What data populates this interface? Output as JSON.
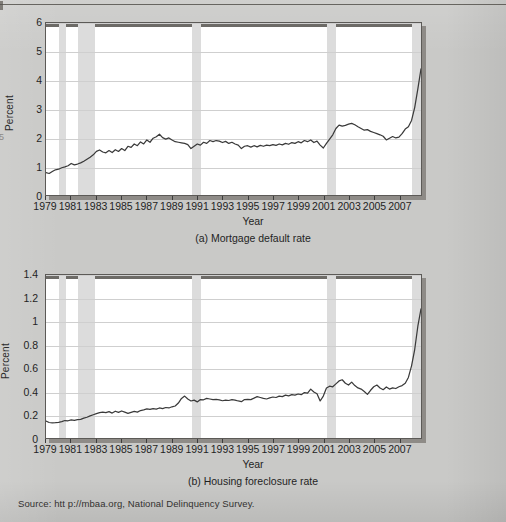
{
  "page": {
    "background_color": "#c9c9c7",
    "source_note": "Source: htt p://mbaa.org, National Delinquency Survey.",
    "margin_number": "5"
  },
  "chart_data": [
    {
      "id": "mortgage-default-rate",
      "type": "line",
      "title": "(a) Mortgage default rate",
      "xlabel": "Year",
      "ylabel": "Percent",
      "ylim": [
        0,
        6
      ],
      "xlim": [
        1979,
        2008.75
      ],
      "yticks": [
        "0",
        "1",
        "2",
        "3",
        "4",
        "5",
        "6"
      ],
      "ytick_values": [
        0,
        1,
        2,
        3,
        4,
        5,
        6
      ],
      "xticks": [
        "1979",
        "1981",
        "1983",
        "1985",
        "1987",
        "1989",
        "1991",
        "1993",
        "1995",
        "1997",
        "1999",
        "2001",
        "2003",
        "2005",
        "2007"
      ],
      "xtick_values": [
        1979,
        1981,
        1983,
        1985,
        1987,
        1989,
        1991,
        1993,
        1995,
        1997,
        1999,
        2001,
        2003,
        2005,
        2007
      ],
      "grid": true,
      "line_color": "#3a3a3a",
      "band_color": "#dcdcdc",
      "recession_bands": [
        [
          1980.0,
          1980.6
        ],
        [
          1981.5,
          1982.9
        ],
        [
          1990.5,
          1991.2
        ],
        [
          2001.2,
          2001.9
        ],
        [
          2007.9,
          2008.75
        ]
      ],
      "x": [
        1979.0,
        1979.25,
        1979.5,
        1979.75,
        1980.0,
        1980.25,
        1980.5,
        1980.75,
        1981.0,
        1981.25,
        1981.5,
        1981.75,
        1982.0,
        1982.25,
        1982.5,
        1982.75,
        1983.0,
        1983.25,
        1983.5,
        1983.75,
        1984.0,
        1984.25,
        1984.5,
        1984.75,
        1985.0,
        1985.25,
        1985.5,
        1985.75,
        1986.0,
        1986.25,
        1986.5,
        1986.75,
        1987.0,
        1987.25,
        1987.5,
        1987.75,
        1988.0,
        1988.25,
        1988.5,
        1988.75,
        1989.0,
        1989.25,
        1989.5,
        1989.75,
        1990.0,
        1990.25,
        1990.5,
        1990.75,
        1991.0,
        1991.25,
        1991.5,
        1991.75,
        1992.0,
        1992.25,
        1992.5,
        1992.75,
        1993.0,
        1993.25,
        1993.5,
        1993.75,
        1994.0,
        1994.25,
        1994.5,
        1994.75,
        1995.0,
        1995.25,
        1995.5,
        1995.75,
        1996.0,
        1996.25,
        1996.5,
        1996.75,
        1997.0,
        1997.25,
        1997.5,
        1997.75,
        1998.0,
        1998.25,
        1998.5,
        1998.75,
        1999.0,
        1999.25,
        1999.5,
        1999.75,
        2000.0,
        2000.25,
        2000.5,
        2000.75,
        2001.0,
        2001.25,
        2001.5,
        2001.75,
        2002.0,
        2002.25,
        2002.5,
        2002.75,
        2003.0,
        2003.25,
        2003.5,
        2003.75,
        2004.0,
        2004.25,
        2004.5,
        2004.75,
        2005.0,
        2005.25,
        2005.5,
        2005.75,
        2006.0,
        2006.25,
        2006.5,
        2006.75,
        2007.0,
        2007.25,
        2007.5,
        2007.75,
        2008.0,
        2008.25,
        2008.5,
        2008.75
      ],
      "values": [
        0.78,
        0.75,
        0.82,
        0.88,
        0.9,
        0.95,
        0.98,
        1.02,
        1.1,
        1.05,
        1.08,
        1.12,
        1.18,
        1.25,
        1.32,
        1.4,
        1.52,
        1.57,
        1.5,
        1.47,
        1.55,
        1.48,
        1.58,
        1.52,
        1.62,
        1.55,
        1.7,
        1.66,
        1.78,
        1.72,
        1.85,
        1.78,
        1.92,
        1.84,
        1.98,
        2.03,
        2.12,
        2.0,
        1.95,
        1.99,
        1.92,
        1.86,
        1.84,
        1.82,
        1.8,
        1.76,
        1.62,
        1.7,
        1.78,
        1.74,
        1.84,
        1.8,
        1.9,
        1.86,
        1.9,
        1.88,
        1.83,
        1.87,
        1.8,
        1.84,
        1.78,
        1.74,
        1.62,
        1.7,
        1.72,
        1.67,
        1.72,
        1.68,
        1.73,
        1.7,
        1.74,
        1.72,
        1.76,
        1.73,
        1.78,
        1.75,
        1.8,
        1.77,
        1.83,
        1.8,
        1.86,
        1.82,
        1.9,
        1.86,
        1.92,
        1.83,
        1.88,
        1.74,
        1.64,
        1.8,
        1.95,
        2.1,
        2.32,
        2.44,
        2.4,
        2.43,
        2.47,
        2.5,
        2.45,
        2.38,
        2.32,
        2.26,
        2.28,
        2.22,
        2.18,
        2.14,
        2.1,
        2.05,
        1.92,
        1.98,
        2.04,
        1.99,
        2.02,
        2.14,
        2.3,
        2.38,
        2.6,
        3.05,
        3.7,
        4.4,
        4.95,
        5.32
      ]
    },
    {
      "id": "housing-foreclosure-rate",
      "type": "line",
      "title": "(b) Housing foreclosure rate",
      "xlabel": "Year",
      "ylabel": "Percent",
      "ylim": [
        0,
        1.4
      ],
      "xlim": [
        1979,
        2008.75
      ],
      "yticks": [
        "0",
        "0.2",
        "0.4",
        "0.6",
        "0.8",
        "1",
        "1.2",
        "1.4"
      ],
      "ytick_values": [
        0,
        0.2,
        0.4,
        0.6,
        0.8,
        1.0,
        1.2,
        1.4
      ],
      "xticks": [
        "1979",
        "1981",
        "1983",
        "1985",
        "1987",
        "1989",
        "1991",
        "1993",
        "1995",
        "1997",
        "1999",
        "2001",
        "2003",
        "2005",
        "2007"
      ],
      "xtick_values": [
        1979,
        1981,
        1983,
        1985,
        1987,
        1989,
        1991,
        1993,
        1995,
        1997,
        1999,
        2001,
        2003,
        2005,
        2007
      ],
      "grid": true,
      "line_color": "#3a3a3a",
      "band_color": "#dcdcdc",
      "recession_bands": [
        [
          1980.0,
          1980.6
        ],
        [
          1981.5,
          1982.9
        ],
        [
          1990.5,
          1991.2
        ],
        [
          2001.2,
          2001.9
        ],
        [
          2007.9,
          2008.75
        ]
      ],
      "x": [
        1979.0,
        1979.25,
        1979.5,
        1979.75,
        1980.0,
        1980.25,
        1980.5,
        1980.75,
        1981.0,
        1981.25,
        1981.5,
        1981.75,
        1982.0,
        1982.25,
        1982.5,
        1982.75,
        1983.0,
        1983.25,
        1983.5,
        1983.75,
        1984.0,
        1984.25,
        1984.5,
        1984.75,
        1985.0,
        1985.25,
        1985.5,
        1985.75,
        1986.0,
        1986.25,
        1986.5,
        1986.75,
        1987.0,
        1987.25,
        1987.5,
        1987.75,
        1988.0,
        1988.25,
        1988.5,
        1988.75,
        1989.0,
        1989.25,
        1989.5,
        1989.75,
        1990.0,
        1990.25,
        1990.5,
        1990.75,
        1991.0,
        1991.25,
        1991.5,
        1991.75,
        1992.0,
        1992.25,
        1992.5,
        1992.75,
        1993.0,
        1993.25,
        1993.5,
        1993.75,
        1994.0,
        1994.25,
        1994.5,
        1994.75,
        1995.0,
        1995.25,
        1995.5,
        1995.75,
        1996.0,
        1996.25,
        1996.5,
        1996.75,
        1997.0,
        1997.25,
        1997.5,
        1997.75,
        1998.0,
        1998.25,
        1998.5,
        1998.75,
        1999.0,
        1999.25,
        1999.5,
        1999.75,
        2000.0,
        2000.25,
        2000.5,
        2000.75,
        2001.0,
        2001.25,
        2001.5,
        2001.75,
        2002.0,
        2002.25,
        2002.5,
        2002.75,
        2003.0,
        2003.25,
        2003.5,
        2003.75,
        2004.0,
        2004.25,
        2004.5,
        2004.75,
        2005.0,
        2005.25,
        2005.5,
        2005.75,
        2006.0,
        2006.25,
        2006.5,
        2006.75,
        2007.0,
        2007.25,
        2007.5,
        2007.75,
        2008.0,
        2008.25,
        2008.5,
        2008.75
      ],
      "values": [
        0.145,
        0.133,
        0.13,
        0.132,
        0.135,
        0.14,
        0.15,
        0.148,
        0.155,
        0.152,
        0.158,
        0.16,
        0.17,
        0.178,
        0.19,
        0.2,
        0.21,
        0.218,
        0.222,
        0.218,
        0.226,
        0.214,
        0.23,
        0.22,
        0.232,
        0.222,
        0.212,
        0.22,
        0.228,
        0.222,
        0.236,
        0.242,
        0.25,
        0.246,
        0.252,
        0.248,
        0.258,
        0.252,
        0.262,
        0.258,
        0.268,
        0.275,
        0.3,
        0.34,
        0.36,
        0.335,
        0.318,
        0.325,
        0.31,
        0.33,
        0.328,
        0.34,
        0.335,
        0.33,
        0.332,
        0.328,
        0.32,
        0.325,
        0.322,
        0.33,
        0.325,
        0.318,
        0.312,
        0.33,
        0.332,
        0.33,
        0.342,
        0.355,
        0.348,
        0.34,
        0.335,
        0.345,
        0.352,
        0.348,
        0.36,
        0.355,
        0.368,
        0.362,
        0.372,
        0.368,
        0.378,
        0.372,
        0.39,
        0.385,
        0.42,
        0.395,
        0.38,
        0.318,
        0.36,
        0.43,
        0.445,
        0.44,
        0.465,
        0.49,
        0.5,
        0.47,
        0.455,
        0.48,
        0.45,
        0.43,
        0.42,
        0.4,
        0.375,
        0.41,
        0.44,
        0.455,
        0.43,
        0.415,
        0.438,
        0.42,
        0.43,
        0.425,
        0.44,
        0.45,
        0.47,
        0.52,
        0.62,
        0.76,
        0.96,
        1.11,
        1.205,
        1.15
      ]
    }
  ]
}
